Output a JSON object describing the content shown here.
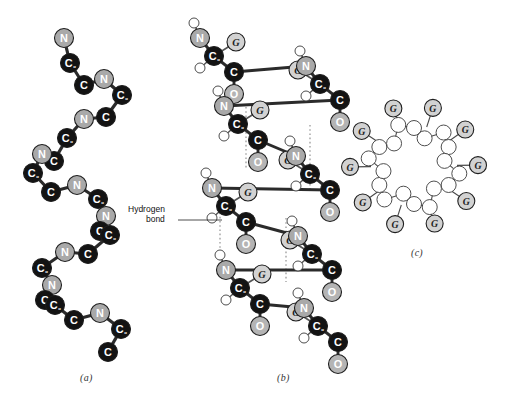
{
  "figure": {
    "panels": [
      {
        "id": "a",
        "label": "(a)",
        "caption_x": 80,
        "caption_y": 378
      },
      {
        "id": "b",
        "label": "(b)",
        "caption_x": 277,
        "caption_y": 378
      },
      {
        "id": "c",
        "label": "(c)",
        "caption_x": 411,
        "caption_y": 252
      }
    ],
    "annotations": [
      {
        "name": "hydrogen-bond",
        "line1": "Hydrogen",
        "line2": "bond",
        "x": 136,
        "y": 209
      }
    ],
    "atom_types": {
      "N": {
        "label": "N",
        "fill": "#a9a9a9",
        "text": "#ffffff",
        "name": "nitrogen"
      },
      "C": {
        "label": "C",
        "fill": "#131313",
        "text": "#ffffff",
        "name": "carbon"
      },
      "CA": {
        "label": "C",
        "sub": "α",
        "fill": "#131313",
        "text": "#ffffff",
        "name": "alpha-carbon"
      },
      "O": {
        "label": "O",
        "fill": "#b4b4b4",
        "text": "#ffffff",
        "name": "oxygen"
      },
      "G": {
        "label": "G",
        "fill": "#d2d2d2",
        "text": "#222222",
        "name": "side-chain-group"
      },
      "H": {
        "label": "",
        "fill": "#ffffff",
        "text": "#000000",
        "name": "hydrogen"
      },
      "R": {
        "label": "",
        "fill": "#ffffff",
        "text": "#000000",
        "name": "ring-atom"
      }
    },
    "legend_note": "N = nitrogen, C = carbon, Cα = alpha carbon, O = oxygen, G = side group, open circles = hydrogen"
  },
  "chart_data": {
    "type": "diagram",
    "panel_a": {
      "name": "backbone-only-helix",
      "description": "Zigzag N-Cα-C backbone of a right-handed alpha helix, side view",
      "atoms": [
        {
          "id": "a1",
          "t": "N",
          "x": 64,
          "y": 38
        },
        {
          "id": "a2",
          "t": "CA",
          "x": 70,
          "y": 63
        },
        {
          "id": "a3",
          "t": "C",
          "x": 84,
          "y": 85
        },
        {
          "id": "a4",
          "t": "N",
          "x": 104,
          "y": 79
        },
        {
          "id": "a5",
          "t": "CA",
          "x": 122,
          "y": 95
        },
        {
          "id": "a6",
          "t": "C",
          "x": 106,
          "y": 117
        },
        {
          "id": "a7",
          "t": "N",
          "x": 84,
          "y": 119
        },
        {
          "id": "a8",
          "t": "CA",
          "x": 67,
          "y": 138
        },
        {
          "id": "a9",
          "t": "C",
          "x": 54,
          "y": 161
        },
        {
          "id": "a10",
          "t": "N",
          "x": 42,
          "y": 154
        },
        {
          "id": "a11",
          "t": "CA",
          "x": 33,
          "y": 173
        },
        {
          "id": "a12",
          "t": "C",
          "x": 51,
          "y": 192
        },
        {
          "id": "a13",
          "t": "N",
          "x": 77,
          "y": 185
        },
        {
          "id": "a14",
          "t": "CA",
          "x": 98,
          "y": 199
        },
        {
          "id": "a15",
          "t": "N",
          "x": 106,
          "y": 216
        },
        {
          "id": "a16",
          "t": "C",
          "x": 100,
          "y": 231
        },
        {
          "id": "a17",
          "t": "CA",
          "x": 110,
          "y": 235
        },
        {
          "id": "a18",
          "t": "C",
          "x": 88,
          "y": 254
        },
        {
          "id": "a19",
          "t": "N",
          "x": 65,
          "y": 252
        },
        {
          "id": "a20",
          "t": "CA",
          "x": 42,
          "y": 268
        },
        {
          "id": "a21",
          "t": "N",
          "x": 52,
          "y": 285
        },
        {
          "id": "a22",
          "t": "C",
          "x": 45,
          "y": 300
        },
        {
          "id": "a23",
          "t": "CA",
          "x": 55,
          "y": 305
        },
        {
          "id": "a24",
          "t": "C",
          "x": 74,
          "y": 320
        },
        {
          "id": "a25",
          "t": "N",
          "x": 100,
          "y": 313
        },
        {
          "id": "a26",
          "t": "CA",
          "x": 121,
          "y": 329
        },
        {
          "id": "a27",
          "t": "C",
          "x": 108,
          "y": 352
        }
      ],
      "bond_count": 26
    },
    "panel_b": {
      "name": "full-atomic-helix-with-hbonds",
      "description": "Alpha helix showing N, Cα, C, O, side group G and amide hydrogens; dotted vertical lines are N-H...O=C hydrogen bonds",
      "hydrogen_bond_count": 4,
      "residues_shown": 7
    },
    "panel_c": {
      "name": "axial-view-helix",
      "description": "View down the helix axis; backbone atoms drawn as open circles forming a ring, side groups G project outward",
      "side_group_count": 10,
      "side_group_label": "G"
    }
  }
}
